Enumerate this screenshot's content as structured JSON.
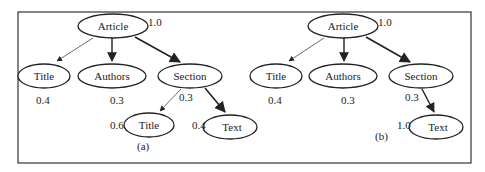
{
  "panels": [
    {
      "id": "a",
      "caption": "(a)",
      "nodes": {
        "article": {
          "label": "Article",
          "weight": "1.0"
        },
        "title": {
          "label": "Title",
          "weight": "0.4"
        },
        "authors": {
          "label": "Authors",
          "weight": "0.3"
        },
        "section": {
          "label": "Section",
          "weight": "0.3"
        },
        "section_title": {
          "label": "Title",
          "weight": "0.6"
        },
        "section_text": {
          "label": "Text",
          "weight": "0.4"
        }
      }
    },
    {
      "id": "b",
      "caption": "(b)",
      "nodes": {
        "article": {
          "label": "Article",
          "weight": "1.0"
        },
        "title": {
          "label": "Title",
          "weight": "0.4"
        },
        "authors": {
          "label": "Authors",
          "weight": "0.3"
        },
        "section": {
          "label": "Section",
          "weight": "0.3"
        },
        "section_text": {
          "label": "Text",
          "weight": "1.0"
        }
      }
    }
  ]
}
